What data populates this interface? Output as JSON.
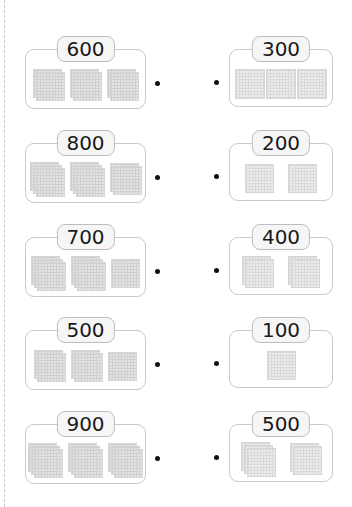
{
  "worksheet": {
    "left_cards": [
      {
        "value_label": "600",
        "value": 600,
        "stacks": [
          2,
          2,
          2
        ]
      },
      {
        "value_label": "800",
        "value": 800,
        "stacks": [
          3,
          3,
          2
        ]
      },
      {
        "value_label": "700",
        "value": 700,
        "stacks": [
          3,
          3,
          1
        ]
      },
      {
        "value_label": "500",
        "value": 500,
        "stacks": [
          2,
          2,
          1
        ]
      },
      {
        "value_label": "900",
        "value": 900,
        "stacks": [
          3,
          3,
          3
        ]
      }
    ],
    "right_cards": [
      {
        "value_label": "300",
        "value": 300,
        "stacks": [
          1,
          1,
          1
        ],
        "arrangement": "joined"
      },
      {
        "value_label": "200",
        "value": 200,
        "stacks": [
          1,
          1
        ]
      },
      {
        "value_label": "400",
        "value": 400,
        "stacks": [
          2,
          2
        ]
      },
      {
        "value_label": "100",
        "value": 100,
        "stacks": [
          1
        ]
      },
      {
        "value_label": "500",
        "value": 500,
        "stacks": [
          3,
          2
        ]
      }
    ],
    "colors": {
      "block_fill": "#e3e3e3",
      "grid_line": "#d0d0d0",
      "card_border": "#c9c9c9",
      "label_fill": "#f6f6f6"
    }
  }
}
